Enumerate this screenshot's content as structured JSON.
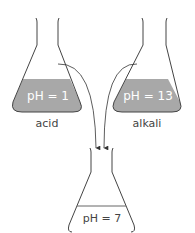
{
  "flasks": [
    {
      "id": "acid",
      "ph_label": "pH = 1",
      "name": "acid",
      "liquid_color": "#a8a8a8"
    },
    {
      "id": "alkali",
      "ph_label": "pH = 13",
      "name": "alkali",
      "liquid_color": "#a8a8a8"
    },
    {
      "id": "neutral",
      "ph_label": "pH = 7",
      "name": "",
      "liquid_color": "#ffffff"
    }
  ],
  "colors": {
    "outline": "#444444",
    "liquid": "#a8a8a8"
  }
}
